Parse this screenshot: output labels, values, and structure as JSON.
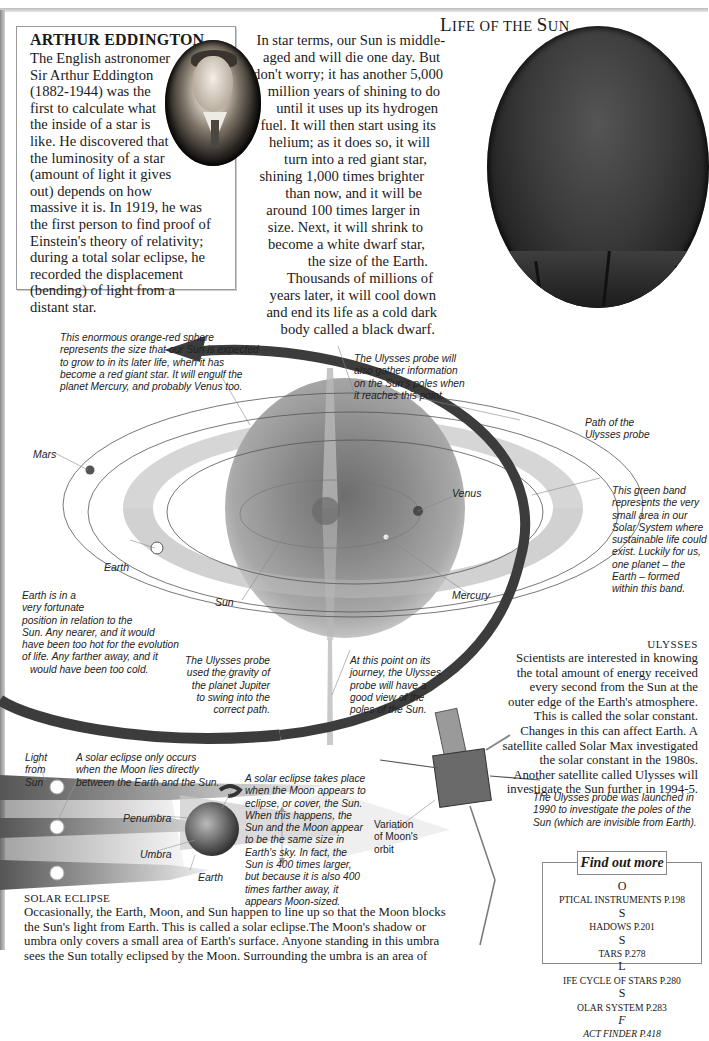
{
  "biography": {
    "title": "ARTHUR EDDINGTON",
    "portrait_alt": "portrait-of-arthur-eddington",
    "lines": [
      "The English astronomer",
      "Sir Arthur Eddington",
      "(1882-1944) was the",
      "first to calculate what",
      "the inside of a star is",
      "like. He discovered that",
      "the luminosity of a star",
      "(amount of light it gives",
      "out) depends on how",
      "massive it is. In 1919, he was",
      "the first person to find proof of",
      "Einstein's theory of relativity;",
      "during a total solar eclipse, he",
      "recorded the displacement",
      "(bending) of light from a",
      "distant star."
    ]
  },
  "life_of_sun": {
    "title_first": "L",
    "title_rest": "IFE OF THE ",
    "title_s": "S",
    "title_end": "UN",
    "lines": [
      "In star terms, our Sun is middle-",
      "aged and will die one day. But",
      "don't worry; it has another 5,000",
      "million years of shining to do",
      "until it uses up its hydrogen",
      "fuel. It will then start using its",
      "helium; as it does so, it will",
      "turn into a red giant star,",
      "shining 1,000 times brighter",
      "than now, and it will be",
      "around 100 times larger in",
      "size. Next, it will shrink to",
      "become a white dwarf star,",
      "the size of the Earth.",
      "Thousands of millions of",
      "years later, it will cool down",
      "and end its life as a cold dark",
      "body called a black dwarf."
    ]
  },
  "diagram": {
    "captions": {
      "red_giant": [
        "This enormous orange-red sphere",
        "represents the size that our Sun is expected",
        "to grow to in its later life, when it has",
        "become a red giant star. It will engulf the",
        "planet Mercury, and probably Venus too."
      ],
      "poles_top": [
        "The Ulysses probe will",
        "also gather information",
        "on the Sun's poles when",
        "it reaches this point."
      ],
      "path": [
        "Path of the",
        "Ulysses probe"
      ],
      "green_band": [
        "This green band",
        "represents the very",
        "small area in our",
        "Solar System where",
        "sustainable life could",
        "exist. Luckily for us,",
        "one planet – the",
        "Earth – formed",
        "within this band."
      ],
      "earth_position": [
        "Earth is in a",
        "very fortunate",
        "position in relation to the",
        "Sun. Any nearer, and it would",
        "have been too hot for the evolution",
        "of life. Any farther away, and it",
        "would have been too cold."
      ],
      "jupiter": [
        "The Ulysses probe",
        "used the gravity of",
        "the planet Jupiter",
        "to swing into the",
        "correct path."
      ],
      "poles_bottom": [
        "At this point on its",
        "journey, the Ulysses",
        "probe will have a",
        "good view of the",
        "poles of the Sun."
      ]
    },
    "labels": {
      "mars": "Mars",
      "venus": "Venus",
      "earth": "Earth",
      "sun": "Sun",
      "mercury": "Mercury"
    },
    "colors": {
      "giant_sphere": "#9a9a9a",
      "habitable_band": "#cfcfcf",
      "path_arrow": "#3c3c3c"
    }
  },
  "ulysses": {
    "title": "ULYSSES",
    "lines": [
      "Scientists are interested in knowing",
      "the total amount of energy received",
      "every second from the Sun at the",
      "outer edge of the Earth's atmosphere.",
      "This is called the solar constant.",
      "Changes in this can affect Earth. A",
      "satellite called Solar Max investigated",
      "the solar constant in the 1980s.",
      "Another satellite called Ulysses will",
      "investigate the Sun further in 1994-5."
    ],
    "probe_caption": [
      "The Ulysses probe was launched in",
      "1990 to investigate the poles of the",
      "Sun (which are invisible from Earth)."
    ]
  },
  "eclipse": {
    "captions": {
      "light": [
        "Light",
        "from",
        "Sun"
      ],
      "only_occurs": [
        "A solar eclipse only occurs",
        "when the Moon lies directly",
        "between the Earth and the Sun."
      ],
      "takes_place": [
        "A solar eclipse takes place",
        "when the Moon appears to",
        "eclipse, or cover, the Sun.",
        "When this happens, the",
        "Sun and the Moon appear",
        "to be the same size in",
        "Earth's sky. In fact, the",
        "Sun is 400 times larger,",
        "but because it is also 400",
        "times farther away, it",
        "appears Moon-sized."
      ],
      "variation": [
        "Variation",
        "of Moon's",
        "orbit"
      ]
    },
    "labels": {
      "penumbra": "Penumbra",
      "umbra": "Umbra",
      "earth": "Earth"
    },
    "title": "SOLAR ECLIPSE",
    "lines": [
      "Occasionally, the Earth, Moon, and Sun happen to line up so that the Moon blocks",
      "the Sun's light from Earth. This is called a solar eclipse.The Moon's shadow or",
      "umbra only covers a small area of Earth's surface. Anyone standing in this umbra",
      "sees the Sun totally eclipsed by the Moon. Surrounding the umbra is an area of"
    ]
  },
  "find_out_more": {
    "heading": "Find out more",
    "items": [
      {
        "cap": "O",
        "rest": "PTICAL INSTRUMENTS P.198"
      },
      {
        "cap": "S",
        "rest": "HADOWS P.201"
      },
      {
        "cap": "S",
        "rest": "TARS P.278"
      },
      {
        "cap": "L",
        "rest": "IFE CYCLE OF STARS P.280"
      },
      {
        "cap": "S",
        "rest": "OLAR SYSTEM P.283"
      },
      {
        "cap": "F",
        "rest": "ACT FINDER P.418"
      }
    ]
  }
}
